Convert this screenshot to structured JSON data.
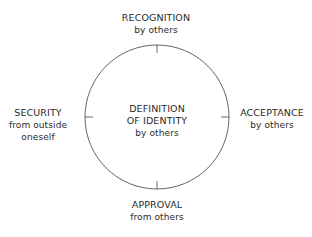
{
  "diagram": {
    "type": "circular-concept-diagram",
    "stroke_color": "#555555",
    "center": {
      "line1": "DEFINITION",
      "line2": "OF IDENTITY",
      "line3": "by others"
    },
    "nodes": [
      {
        "position": "top",
        "title": "RECOGNITION",
        "subtitle": "by others"
      },
      {
        "position": "right",
        "title": "ACCEPTANCE",
        "subtitle": "by others"
      },
      {
        "position": "bottom",
        "title": "APPROVAL",
        "subtitle": "from others"
      },
      {
        "position": "left",
        "title": "SECURITY",
        "subtitle": "from outside",
        "subtitle2": "oneself"
      }
    ]
  }
}
